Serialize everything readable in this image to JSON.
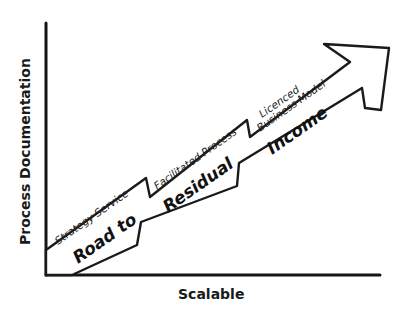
{
  "diagram": {
    "y_axis_label": "Process Documentation",
    "x_axis_label": "Scalable",
    "stages": [
      {
        "label": "Strategy Service"
      },
      {
        "label": "Facilitated Process"
      },
      {
        "label_line1": "Licenced",
        "label_line2": "Business Model"
      }
    ],
    "arrow_text": [
      "Road to",
      "Residual",
      "Income"
    ],
    "colors": {
      "stroke": "#1a1a1a",
      "background": "#ffffff"
    }
  }
}
